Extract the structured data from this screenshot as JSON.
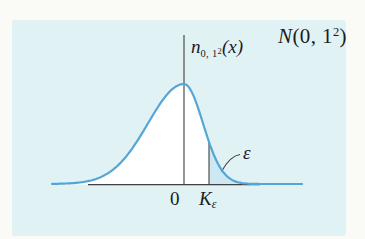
{
  "chart_data": {
    "type": "area",
    "curve_label": "n_{0,1²}(x)",
    "xlabel": "",
    "ylabel": "n_{0,1²}(x)",
    "x_ticks": [
      "0",
      "K_ε"
    ],
    "grid": false,
    "series": [
      {
        "name": "standard normal density",
        "distribution": "normal",
        "mean": 0,
        "sd": 1
      }
    ],
    "annotations": [
      {
        "label": "ε",
        "target": "shaded upper-tail area of the curve to the right of K_ε"
      }
    ],
    "render": {
      "leftX": 52,
      "rightX": 302,
      "peakX": 184,
      "curveBaseY": 184,
      "peakHeight": 100,
      "sigmaLeft": 36,
      "sigmaRight": 19,
      "axisY": 184.6,
      "axisX1": 88,
      "axisX2": 260,
      "meanLineTopY": 35,
      "keX": 209,
      "leaderPath": "M 240,154.5 Q 230,156 221.5,171.5",
      "curveStrokeWidth": 2.2,
      "lineStrokeWidth": 1.1
    }
  },
  "labels": {
    "title_base": "N",
    "title_mid": "(0, 1",
    "title_exp": "2",
    "title_close": ")",
    "fn_base": "n",
    "fn_sub": "0, 1",
    "fn_sub_exp": "2",
    "fn_arg": "(x)",
    "tick_zero": "0",
    "crit_base": "K",
    "crit_sub": "ε",
    "tail_label": "ε"
  },
  "colors": {
    "page_bg": "#fafaf6",
    "panel_bg": "#e1f2f5",
    "under_curve_fill": "#ffffff",
    "tail_fill": "#cde8f2",
    "curve_stroke": "#55a6d8",
    "line_color": "#3f3f3f",
    "text": "#1c1c1c"
  }
}
